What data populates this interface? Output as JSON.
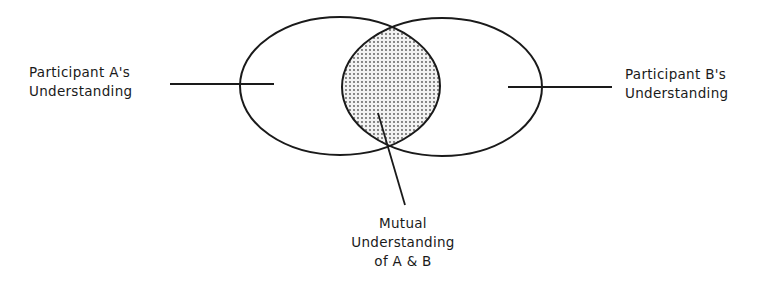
{
  "diagram": {
    "type": "venn",
    "sets": [
      {
        "id": "A",
        "label_line1": "Participant A's",
        "label_line2": "Understanding"
      },
      {
        "id": "B",
        "label_line1": "Participant B's",
        "label_line2": "Understanding"
      }
    ],
    "intersection": {
      "label_line1": "Mutual",
      "label_line2": "Understanding",
      "label_line3": "of A & B",
      "fill": "dotted-gray"
    },
    "colors": {
      "stroke": "#1a1a1a",
      "background": "#ffffff",
      "dots": "#555555"
    }
  }
}
